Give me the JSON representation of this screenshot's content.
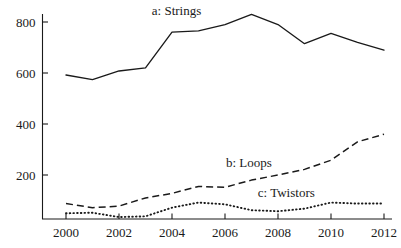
{
  "chart_data": {
    "type": "line",
    "title": "",
    "subtitle": "",
    "xlabel": "",
    "ylabel": "",
    "x": [
      2000,
      2001,
      2002,
      2003,
      2004,
      2005,
      2006,
      2007,
      2008,
      2009,
      2010,
      2011,
      2012
    ],
    "categories": [
      "2000",
      "2001",
      "2002",
      "2003",
      "2004",
      "2005",
      "2006",
      "2007",
      "2008",
      "2009",
      "2010",
      "2011",
      "2012"
    ],
    "xlim": [
      2000,
      2012
    ],
    "ylim": [
      0,
      880
    ],
    "grid": false,
    "legend_position": "inline-annotations",
    "series": [
      {
        "name": "a: Strings",
        "label": "a: Strings",
        "style": "solid",
        "color": "#1a1a1a",
        "values": [
          592,
          574,
          608,
          620,
          760,
          765,
          790,
          830,
          790,
          715,
          755,
          720,
          690
        ]
      },
      {
        "name": "b: Loops",
        "label": "b: Loops",
        "style": "dashed",
        "color": "#1a1a1a",
        "values": [
          88,
          72,
          78,
          110,
          128,
          155,
          152,
          180,
          200,
          222,
          258,
          330,
          360
        ]
      },
      {
        "name": "c: Twistors",
        "label": "c: Twistors",
        "style": "dotted",
        "color": "#1a1a1a",
        "values": [
          50,
          52,
          35,
          38,
          72,
          92,
          85,
          62,
          58,
          68,
          92,
          88,
          88
        ]
      }
    ],
    "annotations": [
      {
        "text": "a: Strings",
        "x": 2003.2,
        "y": 845
      },
      {
        "text": "b: Loops",
        "x": 2006.0,
        "y": 248
      },
      {
        "text": "c: Twistors",
        "x": 2007.2,
        "y": 128
      }
    ],
    "y_ticks": [
      200,
      400,
      600,
      800
    ],
    "y_tick_labels": [
      "200",
      "400",
      "600",
      "800"
    ],
    "x_ticks": [
      2000,
      2002,
      2004,
      2006,
      2008,
      2010,
      2012
    ],
    "x_tick_labels": [
      "2000",
      "2002",
      "2004",
      "2006",
      "2008",
      "2010",
      "2012"
    ],
    "axis_color": "#1a1a1a",
    "background": "#ffffff"
  }
}
